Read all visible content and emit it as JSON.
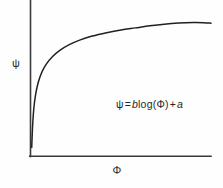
{
  "figure": {
    "name": "logarithmic-response-curve",
    "background_color": "#fefefe",
    "line_color": "#231f20",
    "axis_color": "#3a3a3a",
    "text_color": "#262626"
  },
  "axes": {
    "y_label": "ψ",
    "x_label": "Φ"
  },
  "annotation": {
    "full_text": "ψ = b log (Φ) + a",
    "psi": "ψ",
    "equals": "=",
    "slope_var": "b",
    "log": "log",
    "open_paren": "(",
    "phi": "Φ",
    "close_paren": ")",
    "plus": "+",
    "intercept_var": "a"
  },
  "chart_data": {
    "type": "line",
    "title": "",
    "xlabel": "Φ",
    "ylabel": "ψ",
    "grid": false,
    "legend": "none",
    "axis_style": "open-left-bottom-spines",
    "tick_labels_x": [],
    "tick_labels_y": [],
    "xlim": [
      0,
      100
    ],
    "ylim": [
      0,
      100
    ],
    "equation": "ψ = b log (Φ) + a",
    "series": [
      {
        "name": "ψ = b log (Φ) + a",
        "color": "#231f20",
        "x": [
          0.4,
          0.9,
          1.6,
          2.6,
          4.0,
          6.0,
          8.5,
          12.0,
          16.0,
          21.0,
          27.0,
          34.0,
          42.0,
          50.0,
          58.0,
          66.0,
          74.0,
          82.0,
          90.0,
          96.0,
          100.0
        ],
        "y": [
          6.0,
          22.0,
          35.0,
          45.0,
          53.5,
          61.0,
          67.0,
          72.5,
          77.0,
          81.0,
          84.5,
          87.5,
          90.0,
          92.0,
          93.5,
          95.0,
          96.2,
          97.0,
          97.4,
          97.3,
          96.9
        ]
      }
    ]
  }
}
